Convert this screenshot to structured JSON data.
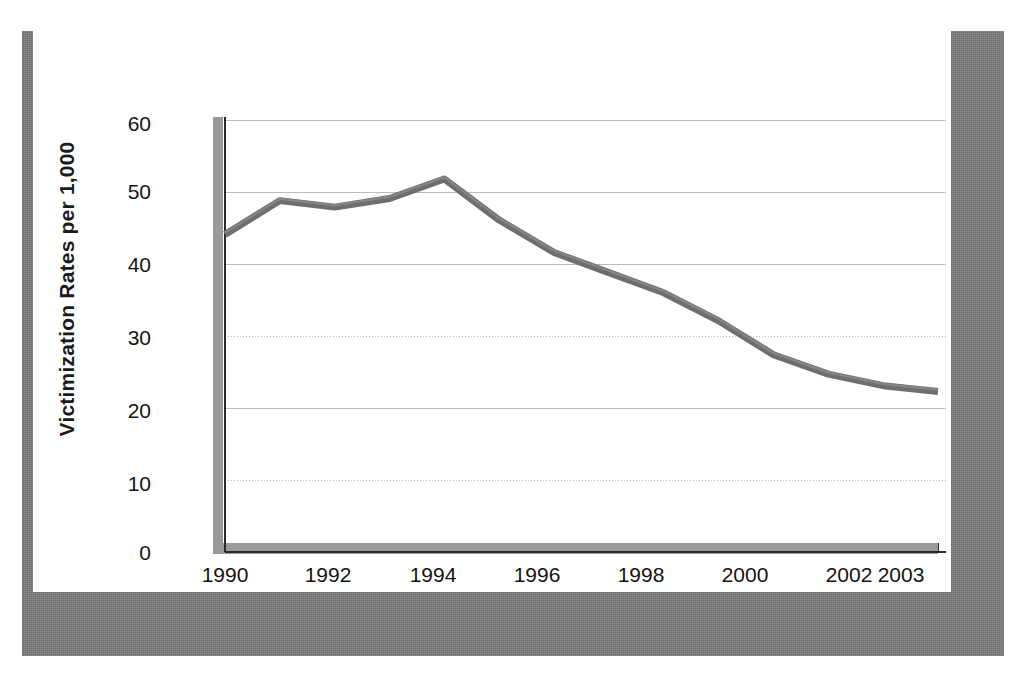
{
  "scan_artifact_text": "· · ·",
  "chart_data": {
    "type": "line",
    "title": "",
    "xlabel": "",
    "ylabel": "Victimization Rates per 1,000",
    "x": [
      1990,
      1991,
      1992,
      1993,
      1994,
      1995,
      1996,
      1997,
      1998,
      1999,
      2000,
      2001,
      2002,
      2003
    ],
    "values": [
      44.1,
      48.8,
      47.9,
      49.1,
      51.8,
      46.1,
      41.6,
      38.8,
      36.0,
      32.1,
      27.4,
      24.7,
      23.1,
      22.3
    ],
    "series": [
      {
        "name": "Victimization rate",
        "values": [
          44.1,
          48.8,
          47.9,
          49.1,
          51.8,
          46.1,
          41.6,
          38.8,
          36.0,
          32.1,
          27.4,
          24.7,
          23.1,
          22.3
        ]
      }
    ],
    "ylim": [
      0,
      60
    ],
    "xlim": [
      1990,
      2003
    ],
    "y_ticks": [
      0,
      10,
      20,
      30,
      40,
      50,
      60
    ],
    "y_tick_labels": [
      "0",
      "10",
      "20",
      "30",
      "40",
      "50",
      "60"
    ],
    "x_ticks": [
      1990,
      1991,
      1992,
      1993,
      1994,
      1995,
      1996,
      1997,
      1998,
      1999,
      2000,
      2001,
      2002,
      2003
    ],
    "x_tick_labels_shown": [
      "1990",
      "1992",
      "1994",
      "1996",
      "1998",
      "2000",
      "2002",
      "2003"
    ],
    "grid": true,
    "grid_axis": "y",
    "legend": false,
    "legend_position": "none",
    "line_color": "#6e6e6e",
    "grid_color": "#bdbdbd",
    "axis_color": "#2b2b2b",
    "frame_color": "#7c7c7c",
    "background_color": "#ffffff"
  },
  "axes": {
    "y_title": "Victimization Rates per 1,000",
    "y_labels": [
      {
        "value": 60,
        "text": "60"
      },
      {
        "value": 50,
        "text": "50"
      },
      {
        "value": 40,
        "text": "40"
      },
      {
        "value": 30,
        "text": "30"
      },
      {
        "value": 20,
        "text": "20"
      },
      {
        "value": 10,
        "text": "10"
      },
      {
        "value": 0,
        "text": "0"
      }
    ],
    "x_labels": [
      {
        "value": 1990,
        "text": "1990"
      },
      {
        "value": 1992,
        "text": "1992"
      },
      {
        "value": 1994,
        "text": "1994"
      },
      {
        "value": 1996,
        "text": "1996"
      },
      {
        "value": 1998,
        "text": "1998"
      },
      {
        "value": 2000,
        "text": "2000"
      },
      {
        "value": 2002,
        "text": "2002"
      },
      {
        "value": 2003,
        "text": "2003"
      }
    ]
  }
}
